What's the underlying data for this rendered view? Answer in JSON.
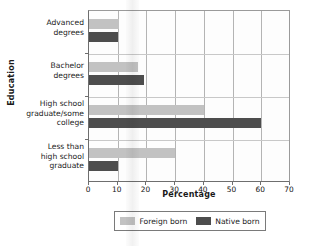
{
  "chart_data": {
    "type": "bar",
    "orientation": "horizontal",
    "title": "",
    "xlabel": "Percentage",
    "ylabel": "Education",
    "xlim": [
      0,
      70
    ],
    "xticks": [
      0,
      10,
      20,
      30,
      40,
      50,
      60,
      70
    ],
    "grid": true,
    "legend_position": "bottom",
    "categories": [
      "Advanced degrees",
      "Bachelor degrees",
      "High school graduate/some college",
      "Less than high school graduate"
    ],
    "category_lines": [
      [
        "Advanced",
        "degrees"
      ],
      [
        "Bachelor",
        "degrees"
      ],
      [
        "High school",
        "graduate/some",
        "college"
      ],
      [
        "Less than",
        "high school",
        "graduate"
      ]
    ],
    "series": [
      {
        "name": "Foreign born",
        "color": "#c2c2c2",
        "values": [
          10.5,
          17,
          40,
          30
        ]
      },
      {
        "name": "Native born",
        "color": "#4d4d4d",
        "values": [
          10,
          19,
          60,
          10
        ]
      }
    ]
  },
  "legend": {
    "items": [
      {
        "label": "Foreign born"
      },
      {
        "label": "Native born"
      }
    ]
  }
}
